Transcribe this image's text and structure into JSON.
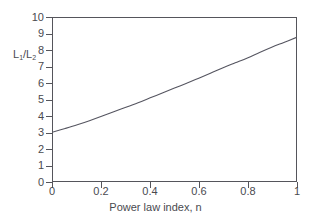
{
  "chart_data": {
    "type": "line",
    "title": "",
    "xlabel": "Power law index, n",
    "ylabel": "L1/L2",
    "ylabel_parts": {
      "num_base": "L",
      "num_sub": "1",
      "slash": "/",
      "den_base": "L",
      "den_sub": "2"
    },
    "xlim": [
      0,
      1
    ],
    "ylim": [
      0,
      10
    ],
    "xticks": [
      0,
      0.2,
      0.4,
      0.6,
      0.8,
      1
    ],
    "xticklabels": [
      "0",
      "0.2",
      "0.4",
      "0.6",
      "0.8",
      "1"
    ],
    "yticks": [
      0,
      1,
      2,
      3,
      4,
      5,
      6,
      7,
      8,
      9,
      10
    ],
    "yticklabels": [
      "0",
      "1",
      "2",
      "3",
      "4",
      "5",
      "6",
      "7",
      "8",
      "9",
      "10"
    ],
    "grid": false,
    "legend": null,
    "series": [
      {
        "name": "L1/L2 vs n",
        "color": "#555560",
        "x": [
          0,
          0.05,
          0.1,
          0.15,
          0.2,
          0.25,
          0.3,
          0.35,
          0.4,
          0.45,
          0.5,
          0.55,
          0.6,
          0.65,
          0.7,
          0.75,
          0.8,
          0.85,
          0.9,
          0.95,
          1
        ],
        "y": [
          3.0,
          3.22,
          3.45,
          3.7,
          3.97,
          4.25,
          4.52,
          4.8,
          5.1,
          5.4,
          5.7,
          6.0,
          6.3,
          6.62,
          6.95,
          7.25,
          7.55,
          7.88,
          8.2,
          8.5,
          8.8
        ]
      }
    ]
  },
  "geometry": {
    "plot_left": 52,
    "plot_top": 17,
    "plot_width": 245,
    "plot_height": 165
  },
  "colors": {
    "axis": "#55555b",
    "curve": "#555560",
    "text": "#4a4a4f",
    "background": "#ffffff"
  }
}
